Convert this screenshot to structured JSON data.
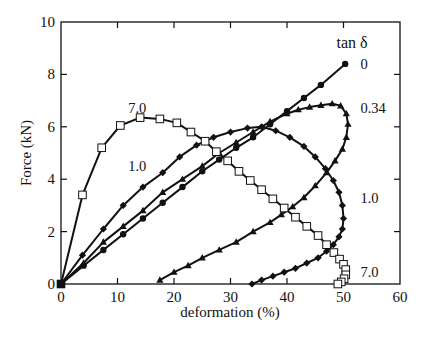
{
  "chart_data": {
    "type": "line",
    "title": "",
    "xlabel": "deformation (%)",
    "ylabel": "Force (kN)",
    "xlim": [
      0,
      60
    ],
    "ylim": [
      0,
      10
    ],
    "xticks": [
      0,
      10,
      20,
      30,
      40,
      50,
      60
    ],
    "yticks": [
      0,
      2,
      4,
      6,
      8,
      10
    ],
    "grid": false,
    "legend_title": "tan δ",
    "legend_position": "inline-right",
    "series": [
      {
        "name": "0",
        "marker": "filled-circle",
        "label_pos": [
          53,
          8.4
        ],
        "x": [
          0,
          4,
          7.5,
          11,
          14.5,
          18,
          21.5,
          25,
          28,
          31,
          34,
          37,
          40,
          43,
          46,
          50.3
        ],
        "y": [
          0,
          0.7,
          1.3,
          1.9,
          2.5,
          3.1,
          3.7,
          4.3,
          4.75,
          5.2,
          5.6,
          6.1,
          6.6,
          7.1,
          7.6,
          8.4
        ]
      },
      {
        "name": "0.34",
        "marker": "filled-triangle",
        "label_pos": [
          53,
          6.7
        ],
        "x": [
          0,
          4,
          7.5,
          11,
          14.5,
          18,
          21.5,
          25,
          28,
          31,
          34,
          37,
          40,
          42,
          44,
          46,
          48,
          49.5,
          50.5,
          50.8,
          50.5,
          49.8,
          48.5,
          47,
          45,
          43,
          41,
          39,
          37,
          34,
          31,
          28,
          25,
          22.5,
          20,
          17.5
        ],
        "y": [
          0,
          0.8,
          1.6,
          2.2,
          2.8,
          3.5,
          4.0,
          4.5,
          5.0,
          5.4,
          5.8,
          6.2,
          6.5,
          6.65,
          6.75,
          6.82,
          6.88,
          6.8,
          6.5,
          6.1,
          5.6,
          5.15,
          4.7,
          4.25,
          3.75,
          3.3,
          2.95,
          2.65,
          2.35,
          2.0,
          1.6,
          1.3,
          1.0,
          0.7,
          0.45,
          0.15
        ]
      },
      {
        "name": "1.0",
        "marker": "filled-diamond",
        "label_pos": [
          53,
          3.3
        ],
        "x": [
          0,
          3.8,
          7.5,
          11,
          14.5,
          18,
          21,
          24,
          27,
          30,
          33,
          35.5,
          38,
          40.5,
          43,
          45,
          46.8,
          48.2,
          49.2,
          49.8,
          50,
          49.8,
          49.2,
          48.2,
          47,
          45.5,
          43.5,
          41.5,
          39.5,
          37.5,
          35.5,
          33.8
        ],
        "y": [
          0,
          1.1,
          2.1,
          3.0,
          3.7,
          4.25,
          4.85,
          5.3,
          5.6,
          5.8,
          5.95,
          6.0,
          5.85,
          5.6,
          5.25,
          4.85,
          4.4,
          3.95,
          3.5,
          3.0,
          2.5,
          2.1,
          1.8,
          1.5,
          1.25,
          1.0,
          0.8,
          0.6,
          0.45,
          0.3,
          0.15,
          0.0
        ]
      },
      {
        "name": "7.0",
        "marker": "open-square",
        "label_pos": [
          53,
          0.45
        ],
        "x": [
          0,
          3.8,
          7.2,
          10.5,
          14,
          17.5,
          20.5,
          23,
          25.5,
          27.5,
          29.5,
          31.5,
          33.5,
          35.5,
          37.5,
          39.5,
          41.5,
          43.5,
          45.5,
          47,
          48.3,
          49.3,
          50,
          50.4,
          50.4,
          50.1,
          49.6,
          49
        ],
        "y": [
          0,
          3.4,
          5.2,
          6.05,
          6.35,
          6.3,
          6.15,
          5.8,
          5.45,
          5.05,
          4.7,
          4.3,
          3.95,
          3.6,
          3.25,
          2.9,
          2.55,
          2.2,
          1.85,
          1.5,
          1.2,
          0.95,
          0.75,
          0.55,
          0.35,
          0.2,
          0.08,
          0.0
        ]
      }
    ],
    "annotations": [
      {
        "text": "7.0",
        "x": 13.5,
        "y": 6.7
      },
      {
        "text": "1.0",
        "x": 13.5,
        "y": 4.5
      }
    ]
  }
}
